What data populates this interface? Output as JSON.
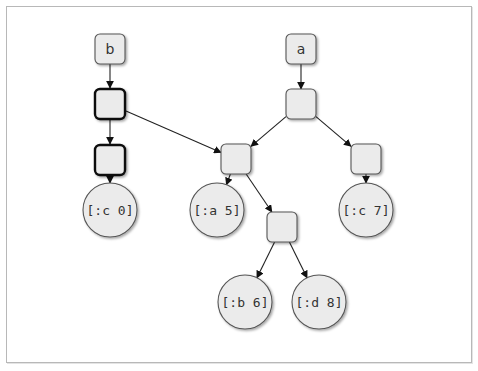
{
  "diagram": {
    "title": "",
    "colors": {
      "node_fill": "#ebebeb",
      "node_stroke": "#555555",
      "bold_stroke": "#111111",
      "edge": "#222222",
      "frame": "#b8b8b8"
    },
    "nodes": [
      {
        "id": "b",
        "kind": "root",
        "label": "b",
        "x": 110,
        "y": 49
      },
      {
        "id": "a",
        "kind": "root",
        "label": "a",
        "x": 301,
        "y": 49
      },
      {
        "id": "nb1",
        "kind": "bold-box",
        "label": "",
        "x": 110,
        "y": 104
      },
      {
        "id": "nb2",
        "kind": "bold-box",
        "label": "",
        "x": 110,
        "y": 160
      },
      {
        "id": "na1",
        "kind": "box",
        "label": "",
        "x": 301,
        "y": 104
      },
      {
        "id": "nm",
        "kind": "box",
        "label": "",
        "x": 236,
        "y": 159
      },
      {
        "id": "nr",
        "kind": "box",
        "label": "",
        "x": 366,
        "y": 159
      },
      {
        "id": "nl",
        "kind": "box",
        "label": "",
        "x": 282,
        "y": 227
      },
      {
        "id": "c0",
        "kind": "leaf",
        "label": "[:c 0]",
        "x": 110,
        "y": 210
      },
      {
        "id": "a5",
        "kind": "leaf",
        "label": "[:a 5]",
        "x": 217,
        "y": 210
      },
      {
        "id": "c7",
        "kind": "leaf",
        "label": "[:c 7]",
        "x": 366,
        "y": 210
      },
      {
        "id": "b6",
        "kind": "leaf",
        "label": "[:b 6]",
        "x": 245,
        "y": 302
      },
      {
        "id": "d8",
        "kind": "leaf",
        "label": "[:d 8]",
        "x": 319,
        "y": 302
      }
    ],
    "edges": [
      {
        "from": "b",
        "to": "nb1"
      },
      {
        "from": "nb1",
        "to": "nb2"
      },
      {
        "from": "nb2",
        "to": "c0"
      },
      {
        "from": "nb1",
        "to": "nm"
      },
      {
        "from": "a",
        "to": "na1"
      },
      {
        "from": "na1",
        "to": "nm"
      },
      {
        "from": "na1",
        "to": "nr"
      },
      {
        "from": "nr",
        "to": "c7"
      },
      {
        "from": "nm",
        "to": "a5"
      },
      {
        "from": "nm",
        "to": "nl"
      },
      {
        "from": "nl",
        "to": "b6"
      },
      {
        "from": "nl",
        "to": "d8"
      }
    ]
  }
}
